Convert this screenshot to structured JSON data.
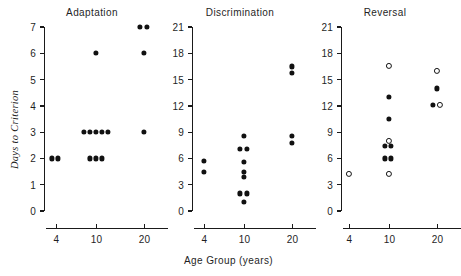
{
  "figure": {
    "ylabel": "Days to Criterion",
    "xlabel": "Age Group  (years)"
  },
  "chart_data": {
    "type": "scatter",
    "xlabel": "Age Group  (years)",
    "ylabel": "Days to Criterion",
    "grid": false,
    "legend": "none",
    "x_categories": [
      "4",
      "10",
      "20"
    ],
    "marker_types": [
      "filled-circle",
      "open-circle"
    ],
    "panels": [
      {
        "title": "Adaptation",
        "ylim": [
          0,
          7
        ],
        "yticks": [
          "0",
          "1",
          "2",
          "3",
          "4",
          "5",
          "6",
          "7"
        ],
        "ytick_values": [
          0,
          1,
          2,
          3,
          4,
          5,
          6,
          7
        ],
        "xticks": [
          "4",
          "10",
          "20"
        ],
        "points": [
          {
            "age": "4",
            "value": 2,
            "marker": "filled",
            "offset": -4
          },
          {
            "age": "4",
            "value": 2,
            "marker": "filled",
            "offset": 2
          },
          {
            "age": "10",
            "value": 2,
            "marker": "filled",
            "offset": -6
          },
          {
            "age": "10",
            "value": 2,
            "marker": "filled",
            "offset": 0
          },
          {
            "age": "10",
            "value": 2,
            "marker": "filled",
            "offset": 6
          },
          {
            "age": "10",
            "value": 3,
            "marker": "filled",
            "offset": -12
          },
          {
            "age": "10",
            "value": 3,
            "marker": "filled",
            "offset": -6
          },
          {
            "age": "10",
            "value": 3,
            "marker": "filled",
            "offset": 0
          },
          {
            "age": "10",
            "value": 3,
            "marker": "filled",
            "offset": 6
          },
          {
            "age": "10",
            "value": 3,
            "marker": "filled",
            "offset": 12
          },
          {
            "age": "10",
            "value": 6,
            "marker": "filled",
            "offset": 0
          },
          {
            "age": "20",
            "value": 3,
            "marker": "filled",
            "offset": 0
          },
          {
            "age": "20",
            "value": 6,
            "marker": "filled",
            "offset": 0
          },
          {
            "age": "20",
            "value": 7,
            "marker": "filled",
            "offset": -4
          },
          {
            "age": "20",
            "value": 7,
            "marker": "filled",
            "offset": 3
          }
        ]
      },
      {
        "title": "Discrimination",
        "ylim": [
          0,
          21
        ],
        "yticks": [
          "0",
          "3",
          "6",
          "9",
          "12",
          "15",
          "18",
          "21"
        ],
        "ytick_values": [
          0,
          3,
          6,
          9,
          12,
          15,
          18,
          21
        ],
        "xticks": [
          "4",
          "10",
          "20"
        ],
        "points": [
          {
            "age": "4",
            "value": 5.7,
            "marker": "filled",
            "offset": 0
          },
          {
            "age": "4",
            "value": 4.5,
            "marker": "filled",
            "offset": 0
          },
          {
            "age": "10",
            "value": 8.6,
            "marker": "filled",
            "offset": 0
          },
          {
            "age": "10",
            "value": 7.1,
            "marker": "filled",
            "offset": -4
          },
          {
            "age": "10",
            "value": 7.1,
            "marker": "filled",
            "offset": 3
          },
          {
            "age": "10",
            "value": 5.6,
            "marker": "filled",
            "offset": 0
          },
          {
            "age": "10",
            "value": 4.5,
            "marker": "filled",
            "offset": 0
          },
          {
            "age": "10",
            "value": 3.9,
            "marker": "filled",
            "offset": 0
          },
          {
            "age": "10",
            "value": 2.0,
            "marker": "filled",
            "offset": -4
          },
          {
            "age": "10",
            "value": 2.0,
            "marker": "filled",
            "offset": 3
          },
          {
            "age": "10",
            "value": 1.0,
            "marker": "filled",
            "offset": 0
          },
          {
            "age": "20",
            "value": 16.5,
            "marker": "filled",
            "offset": 0
          },
          {
            "age": "20",
            "value": 15.8,
            "marker": "filled",
            "offset": 0
          },
          {
            "age": "20",
            "value": 8.6,
            "marker": "filled",
            "offset": 0
          },
          {
            "age": "20",
            "value": 7.8,
            "marker": "filled",
            "offset": 0
          }
        ]
      },
      {
        "title": "Reversal",
        "ylim": [
          0,
          21
        ],
        "yticks": [
          "0",
          "3",
          "6",
          "9",
          "12",
          "15",
          "18",
          "21"
        ],
        "ytick_values": [
          0,
          3,
          6,
          9,
          12,
          15,
          18,
          21
        ],
        "xticks": [
          "4",
          "10",
          "20"
        ],
        "points": [
          {
            "age": "4",
            "value": 4.2,
            "marker": "open",
            "offset": 0
          },
          {
            "age": "10",
            "value": 16.6,
            "marker": "open",
            "offset": 0
          },
          {
            "age": "10",
            "value": 13.0,
            "marker": "filled",
            "offset": 0
          },
          {
            "age": "10",
            "value": 10.5,
            "marker": "filled",
            "offset": 0
          },
          {
            "age": "10",
            "value": 8.0,
            "marker": "open",
            "offset": 0
          },
          {
            "age": "10",
            "value": 7.4,
            "marker": "filled",
            "offset": -4
          },
          {
            "age": "10",
            "value": 7.4,
            "marker": "filled",
            "offset": 2
          },
          {
            "age": "10",
            "value": 6.0,
            "marker": "filled",
            "offset": -4
          },
          {
            "age": "10",
            "value": 6.0,
            "marker": "filled",
            "offset": 2
          },
          {
            "age": "10",
            "value": 4.2,
            "marker": "open",
            "offset": 0
          },
          {
            "age": "20",
            "value": 16.0,
            "marker": "open",
            "offset": 0
          },
          {
            "age": "20",
            "value": 14.0,
            "marker": "filled",
            "offset": 0
          },
          {
            "age": "20",
            "value": 12.1,
            "marker": "filled",
            "offset": -4
          },
          {
            "age": "20",
            "value": 12.1,
            "marker": "open",
            "offset": 3
          }
        ]
      }
    ]
  }
}
